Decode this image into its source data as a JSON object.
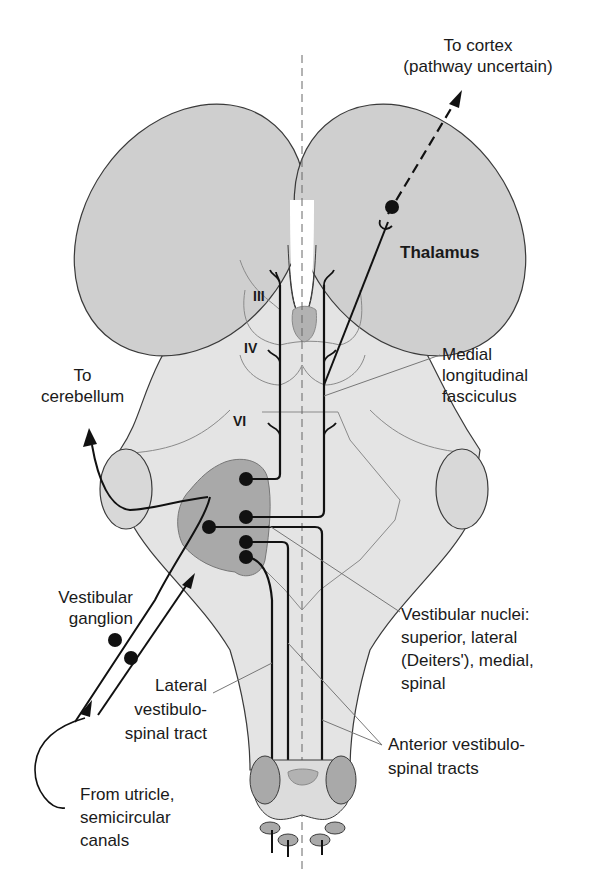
{
  "figure": {
    "colors": {
      "background": "#ffffff",
      "brainstem_fill": "#e4e4e4",
      "thalamus_fill": "#cfcfcf",
      "nucleus_fill": "#a9a9a9",
      "outline": "#3a3a3a",
      "thin_line": "#8a8a8a",
      "tract": "#111111"
    }
  },
  "labels": {
    "to_cortex": [
      "To cortex",
      "(pathway uncertain)"
    ],
    "thalamus": "Thalamus",
    "nerve_iii": "III",
    "nerve_iv": "IV",
    "nerve_vi": "VI",
    "to_cerebellum": [
      "To",
      "cerebellum"
    ],
    "mlf": [
      "Medial",
      "longitudinal",
      "fasciculus"
    ],
    "vestibular_ganglion": [
      "Vestibular",
      "ganglion"
    ],
    "vestibular_nuclei": [
      "Vestibular nuclei:",
      "superior, lateral",
      "(Deiters'), medial,",
      "spinal"
    ],
    "lateral_vst": [
      "Lateral",
      "vestibulo-",
      "spinal tract"
    ],
    "anterior_vst": [
      "Anterior vestibulo-",
      "spinal tracts"
    ],
    "from_utricle": [
      "From utricle,",
      "semicircular",
      "canals"
    ]
  }
}
